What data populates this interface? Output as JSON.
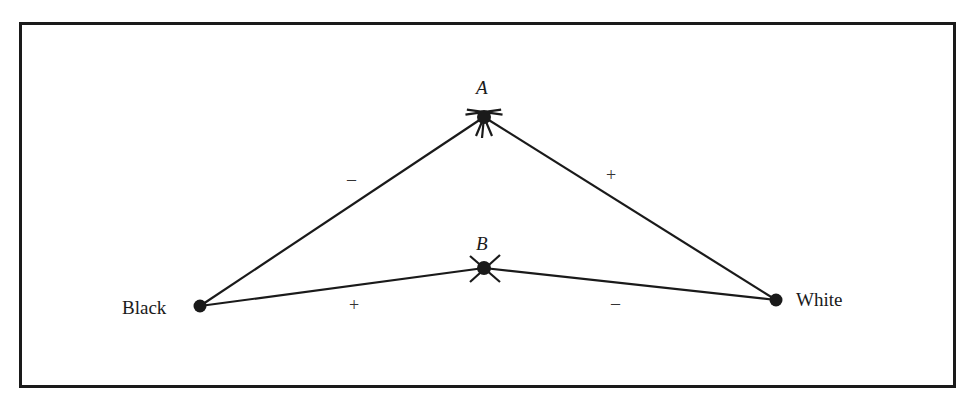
{
  "diagram": {
    "type": "signed-graph",
    "colors": {
      "ink": "#1a1a1a",
      "background": "#ffffff"
    },
    "nodes": [
      {
        "id": "A",
        "label": "A",
        "style": "italic",
        "x": 484,
        "y": 117,
        "mark": "starred-dot"
      },
      {
        "id": "B",
        "label": "B",
        "style": "italic",
        "x": 484,
        "y": 268,
        "mark": "crossed-dot"
      },
      {
        "id": "Black",
        "label": "Black",
        "style": "roman",
        "x": 200,
        "y": 306,
        "mark": "dot"
      },
      {
        "id": "White",
        "label": "White",
        "style": "roman",
        "x": 776,
        "y": 300,
        "mark": "dot"
      }
    ],
    "edges": [
      {
        "from": "Black",
        "to": "A",
        "sign": "–"
      },
      {
        "from": "A",
        "to": "White",
        "sign": "+"
      },
      {
        "from": "Black",
        "to": "B",
        "sign": "+"
      },
      {
        "from": "B",
        "to": "White",
        "sign": "–"
      }
    ]
  }
}
